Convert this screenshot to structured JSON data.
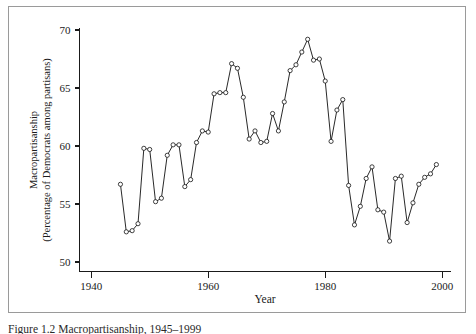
{
  "figure": {
    "caption": "Figure 1.2  Macropartisanship, 1945–1999"
  },
  "chart_data": {
    "type": "line",
    "title": "",
    "subtitle": "",
    "xlabel": "Year",
    "ylabel": "Macropartisanship\n(Percentage of Democrats among partisans)",
    "ylabel_line1": "Macropartisanship",
    "ylabel_line2": "(Percentage of Democrats among partisans)",
    "xlim": [
      1938,
      2001
    ],
    "ylim": [
      49.2,
      70.6
    ],
    "xticks": [
      1940,
      1960,
      1980,
      2000
    ],
    "xtick_labels": [
      "1940",
      "1960",
      "1980",
      "2000"
    ],
    "yticks": [
      50,
      55,
      60,
      65,
      70
    ],
    "ytick_labels": [
      "50",
      "55",
      "60",
      "65",
      "70"
    ],
    "grid": false,
    "legend": null,
    "marker": "open-circle",
    "line_color": "#111111",
    "marker_fill": "#ffffff",
    "series": [
      {
        "name": "Macropartisanship",
        "x": [
          1945,
          1946,
          1947,
          1948,
          1949,
          1950,
          1951,
          1952,
          1953,
          1954,
          1955,
          1956,
          1957,
          1958,
          1959,
          1960,
          1961,
          1962,
          1963,
          1964,
          1965,
          1966,
          1967,
          1968,
          1969,
          1970,
          1971,
          1972,
          1973,
          1974,
          1975,
          1976,
          1977,
          1978,
          1979,
          1980,
          1981,
          1982,
          1983,
          1984,
          1985,
          1986,
          1987,
          1988,
          1989,
          1990,
          1991,
          1992,
          1993,
          1994,
          1995,
          1996,
          1997,
          1998,
          1999
        ],
        "values": [
          56.7,
          52.6,
          52.7,
          53.3,
          59.8,
          59.7,
          55.2,
          55.5,
          59.2,
          60.1,
          60.1,
          56.5,
          57.1,
          60.3,
          61.3,
          61.2,
          64.5,
          64.6,
          64.6,
          67.1,
          66.7,
          64.2,
          60.6,
          61.3,
          60.3,
          60.4,
          62.8,
          61.3,
          63.8,
          66.5,
          67.0,
          68.1,
          69.2,
          67.4,
          67.5,
          65.6,
          60.4,
          63.1,
          64.0,
          56.6,
          53.2,
          54.8,
          57.2,
          58.2,
          54.5,
          54.3,
          51.8,
          57.2,
          57.4,
          53.4,
          55.1,
          56.7,
          57.3,
          57.6,
          58.4
        ]
      }
    ]
  }
}
